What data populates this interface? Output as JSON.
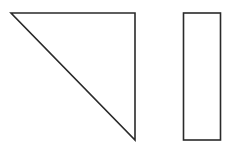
{
  "diagram": {
    "background": "#ffffff",
    "stroke_color": "#2a2a2a",
    "stroke_width": 1.6,
    "shapes": [
      {
        "id": "right-triangle",
        "type": "polygon",
        "points": "11,13 135,13 135,140"
      },
      {
        "id": "tall-rectangle",
        "type": "rect",
        "x": 183.5,
        "y": 13,
        "width": 37,
        "height": 127
      }
    ]
  }
}
